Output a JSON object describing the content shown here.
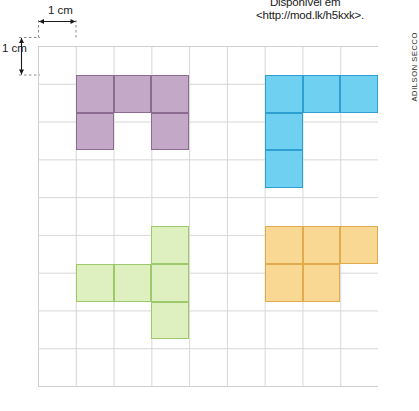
{
  "credits": {
    "source_line1": "Disponível em",
    "source_line2": "<http://mod.lk/h5kxk>.",
    "illustrator": "ADILSON SECCO"
  },
  "measurements": {
    "horizontal_label": "1 cm",
    "vertical_label": "1 cm"
  },
  "grid": {
    "columns": 9,
    "rows": 9,
    "cell_size_px": 37.8,
    "line_color": "#d6d6d6",
    "origin_x_px": 38,
    "origin_y_px": 37
  },
  "shapes": [
    {
      "name": "purple-u-pentomino",
      "color_fill": "#c4a8c8",
      "color_stroke": "#8b6b90",
      "area_cells": 5,
      "cells": [
        [
          1,
          1
        ],
        [
          2,
          1
        ],
        [
          3,
          1
        ],
        [
          1,
          2
        ],
        [
          3,
          2
        ]
      ]
    },
    {
      "name": "blue-v-pentomino",
      "color_fill": "#6fd0f2",
      "color_stroke": "#2e9fd0",
      "area_cells": 5,
      "cells": [
        [
          6,
          1
        ],
        [
          7,
          1
        ],
        [
          8,
          1
        ],
        [
          6,
          2
        ],
        [
          6,
          3
        ]
      ]
    },
    {
      "name": "green-plus-pentomino",
      "color_fill": "#dff0c0",
      "color_stroke": "#9ec96a",
      "area_cells": 5,
      "cells": [
        [
          3,
          5
        ],
        [
          1,
          6
        ],
        [
          2,
          6
        ],
        [
          3,
          6
        ],
        [
          3,
          7
        ]
      ]
    },
    {
      "name": "orange-p-pentomino",
      "color_fill": "#f9d893",
      "color_stroke": "#e0ab4e",
      "area_cells": 5,
      "cells": [
        [
          6,
          5
        ],
        [
          7,
          5
        ],
        [
          8,
          5
        ],
        [
          6,
          6
        ],
        [
          7,
          6
        ]
      ]
    }
  ]
}
